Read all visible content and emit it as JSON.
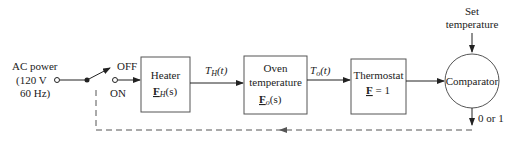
{
  "diagram": {
    "type": "block-diagram",
    "source": {
      "line1": "AC power",
      "line2": "(120 V",
      "line3": "60 Hz)"
    },
    "switch": {
      "off_label": "OFF",
      "on_label": "ON"
    },
    "blocks": [
      {
        "id": "heater",
        "title": "Heater",
        "tf": "F",
        "tf_sub": "H",
        "tf_arg": "(s)"
      },
      {
        "id": "oven",
        "title1": "Oven",
        "title2": "temperature",
        "tf": "F",
        "tf_sub": "o",
        "tf_arg": "(s)"
      },
      {
        "id": "thermostat",
        "title": "Thermostat",
        "tf": "F",
        "tf_rest": " = 1"
      }
    ],
    "signals": [
      {
        "label": "T",
        "sub": "H",
        "arg": "(t)"
      },
      {
        "label": "T",
        "sub": "o",
        "arg": "(t)"
      }
    ],
    "comparator": {
      "label": "Comparator"
    },
    "setpoint": {
      "line1": "Set",
      "line2": "temperature"
    },
    "output": {
      "label": "0 or 1"
    }
  }
}
